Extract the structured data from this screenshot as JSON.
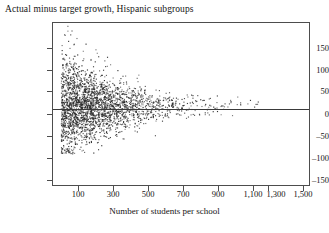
{
  "figure": {
    "title": "Actual minus target growth, Hispanic subgroups"
  },
  "axes": {
    "x_label": "Number of students per school",
    "y_label": "",
    "x_ticks": [
      "100",
      "300",
      "500",
      "700",
      "900",
      "1,100",
      "1,300",
      "1,500"
    ],
    "y_ticks": [
      "150",
      "100",
      "50",
      "0",
      "–50",
      "–100",
      "–150"
    ]
  },
  "chart_data": {
    "type": "scatter",
    "title": "Actual minus target growth, Hispanic subgroups",
    "xlabel": "Number of students per school",
    "ylabel": "",
    "xlim": [
      0,
      1550
    ],
    "ylim": [
      -160,
      185
    ],
    "x_tick_values": [
      100,
      300,
      500,
      700,
      900,
      1100,
      1300,
      1500
    ],
    "y_tick_values": [
      150,
      100,
      50,
      0,
      -50,
      -100,
      -150
    ],
    "grid": false,
    "legend": "none",
    "marker": "small filled square",
    "marker_color": "#2b2b2b",
    "annotations": [
      {
        "type": "horizontal-reference-line",
        "y": 5,
        "color": "#3a3a3a",
        "description": "horizontal line near zero spanning full plot width"
      }
    ],
    "series": [
      {
        "name": "Hispanic subgroups",
        "n_points_approx": 2600,
        "x_range": [
          50,
          1250
        ],
        "y_range": [
          -95,
          180
        ],
        "funnel": {
          "center": 8,
          "spread_at_x": [
            {
              "x": 60,
              "sd": 52
            },
            {
              "x": 150,
              "sd": 44
            },
            {
              "x": 300,
              "sd": 33
            },
            {
              "x": 500,
              "sd": 22
            },
            {
              "x": 700,
              "sd": 14
            },
            {
              "x": 900,
              "sd": 10
            },
            {
              "x": 1100,
              "sd": 8
            }
          ]
        },
        "density_by_x_bin": [
          {
            "x_bin": [
              50,
              150
            ],
            "count": 760
          },
          {
            "x_bin": [
              150,
              250
            ],
            "count": 640
          },
          {
            "x_bin": [
              250,
              350
            ],
            "count": 430
          },
          {
            "x_bin": [
              350,
              450
            ],
            "count": 290
          },
          {
            "x_bin": [
              450,
              550
            ],
            "count": 180
          },
          {
            "x_bin": [
              550,
              650
            ],
            "count": 110
          },
          {
            "x_bin": [
              650,
              750
            ],
            "count": 62
          },
          {
            "x_bin": [
              750,
              850
            ],
            "count": 40
          },
          {
            "x_bin": [
              850,
              950
            ],
            "count": 26
          },
          {
            "x_bin": [
              950,
              1050
            ],
            "count": 17
          },
          {
            "x_bin": [
              1050,
              1150
            ],
            "count": 11
          },
          {
            "x_bin": [
              1150,
              1250
            ],
            "count": 6
          }
        ],
        "notable_outliers": [
          {
            "x": 90,
            "y": 178
          },
          {
            "x": 115,
            "y": 168
          },
          {
            "x": 70,
            "y": 160
          },
          {
            "x": 145,
            "y": 152
          },
          {
            "x": 200,
            "y": 140
          },
          {
            "x": 260,
            "y": 128
          },
          {
            "x": 330,
            "y": 112
          },
          {
            "x": 120,
            "y": -92
          },
          {
            "x": 95,
            "y": -78
          },
          {
            "x": 175,
            "y": -70
          },
          {
            "x": 430,
            "y": -62
          },
          {
            "x": 620,
            "y": -55
          }
        ]
      }
    ]
  }
}
